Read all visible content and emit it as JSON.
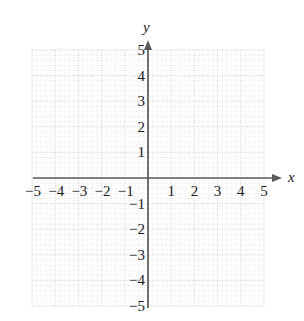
{
  "figure": {
    "kind": "cartesian-coordinate-grid",
    "background_color": "#ffffff",
    "axis_color": "#5a5a5a",
    "grid_major_color": "#c8c8c8",
    "grid_minor_color": "#dcdcdc",
    "label_color": "#1a1a1a"
  },
  "axes": {
    "x_axis_label": "x",
    "y_axis_label": "y",
    "x_arrow": "right-arrowhead",
    "y_arrow": "up-arrowhead"
  },
  "chart_data": {
    "type": "scatter",
    "title": "",
    "subtitle": "",
    "xlabel": "x",
    "ylabel": "y",
    "xlim": [
      -5,
      5
    ],
    "ylim": [
      -5,
      5
    ],
    "xticks": [
      -5,
      -4,
      -3,
      -2,
      -1,
      1,
      2,
      3,
      4,
      5
    ],
    "yticks": [
      5,
      4,
      3,
      2,
      1,
      -1,
      -2,
      -3,
      -4,
      -5
    ],
    "xtick_labels": [
      "−5",
      "−4",
      "−3",
      "−2",
      "−1",
      "1",
      "2",
      "3",
      "4",
      "5"
    ],
    "ytick_labels": [
      "5",
      "4",
      "3",
      "2",
      "1",
      "−1",
      "−2",
      "−3",
      "−4",
      "−5"
    ],
    "grid": true,
    "grid_style": "dotted",
    "minor_grid": true,
    "minor_ticks_per_cell": 5,
    "legend": null,
    "series": [],
    "annotations": [],
    "points": []
  }
}
